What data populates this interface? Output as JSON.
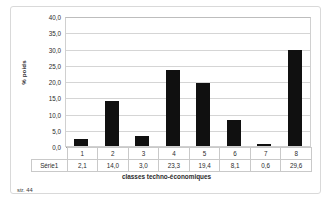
{
  "chart_data": {
    "type": "bar",
    "title": "",
    "xlabel": "classes techno-économiques",
    "ylabel": "% poids",
    "categories": [
      "1",
      "2",
      "3",
      "4",
      "5",
      "6",
      "7",
      "8"
    ],
    "values": [
      2.1,
      14.0,
      3.0,
      23.3,
      19.4,
      8.1,
      0.6,
      29.6
    ],
    "value_labels": [
      "2,1",
      "14,0",
      "3,0",
      "23,3",
      "19,4",
      "8,1",
      "0,6",
      "29,6"
    ],
    "series": [
      {
        "name": "Série1",
        "values": [
          2.1,
          14.0,
          3.0,
          23.3,
          19.4,
          8.1,
          0.6,
          29.6
        ]
      }
    ],
    "ylim": [
      0,
      40
    ],
    "ytick_labels": [
      "40,0",
      "35,0",
      "30,0",
      "25,0",
      "20,0",
      "15,0",
      "10,0",
      "5,0",
      "0,0"
    ],
    "ytick_values": [
      40,
      35,
      30,
      25,
      20,
      15,
      10,
      5,
      0
    ],
    "grid": true,
    "legend": "data-table",
    "bar_color": "#101010",
    "gridline_color": "#d5d5d5",
    "axis_color": "#9e9e9e"
  },
  "series_label": "Série1",
  "footer": {
    "page_note": "str. 44"
  }
}
